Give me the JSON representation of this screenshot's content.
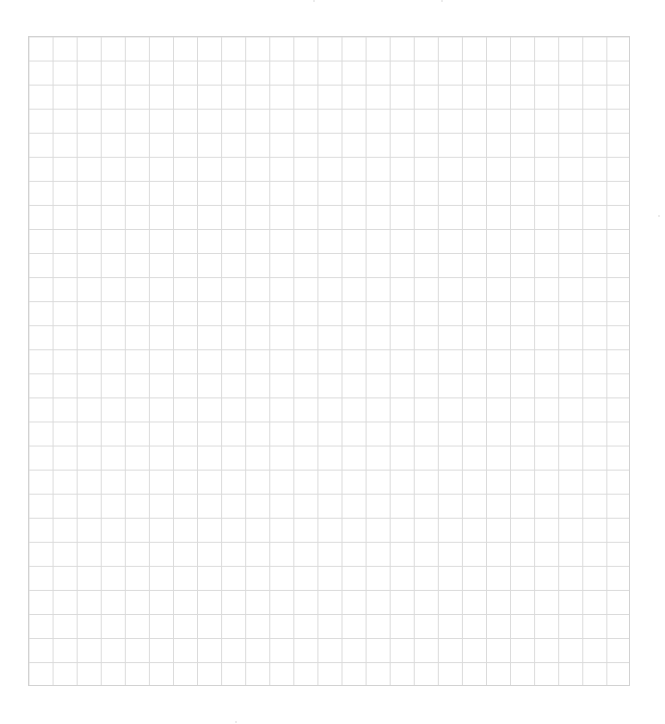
{
  "sheet": {
    "type": "blank graph paper grid",
    "columns": 25,
    "rows": 27,
    "cell_size_px": 24,
    "line_color": "#dadada",
    "border_color": "#d2d2d2",
    "background_color": "#ffffff"
  }
}
